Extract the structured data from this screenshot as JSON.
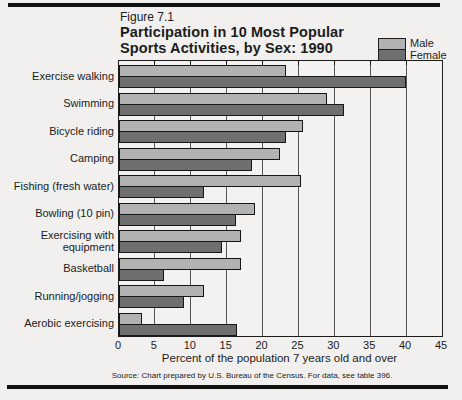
{
  "figure": {
    "label": "Figure 7.1",
    "title_line1": "Participation in 10 Most Popular",
    "title_line2": "Sports Activities, by Sex: 1990"
  },
  "legend": {
    "male_label": "Male",
    "female_label": "Female"
  },
  "axis": {
    "label": "Percent of the population 7 years old and over",
    "ticks": [
      0,
      5,
      10,
      15,
      20,
      25,
      30,
      35,
      40,
      45
    ],
    "min": 0,
    "max": 45
  },
  "source": "Source: Chart prepared by U.S. Bureau of the Census. For data, see table 396.",
  "colors": {
    "male": "#b2b2b2",
    "female": "#6f6f6f",
    "line": "#1c1c1c",
    "paper": "#f1f0ee"
  },
  "chart_data": {
    "type": "bar",
    "orientation": "horizontal",
    "title": "Participation in 10 Most Popular Sports Activities, by Sex: 1990",
    "xlabel": "Percent of the population 7 years old and over",
    "xlim": [
      0,
      45
    ],
    "gridline_step": 5,
    "gridlines": true,
    "legend_position": "top-right",
    "categories": [
      "Exercise walking",
      "Swimming",
      "Bicycle riding",
      "Camping",
      "Fishing (fresh water)",
      "Bowling (10 pin)",
      "Exercising with equipment",
      "Basketball",
      "Running/jogging",
      "Aerobic exercising"
    ],
    "series": [
      {
        "name": "Male",
        "values": [
          23.2,
          29.0,
          25.7,
          22.4,
          25.3,
          19.0,
          17.0,
          17.0,
          11.8,
          3.2
        ]
      },
      {
        "name": "Female",
        "values": [
          40.0,
          31.3,
          23.2,
          18.5,
          11.8,
          16.3,
          14.4,
          6.3,
          9.1,
          16.5
        ]
      }
    ]
  }
}
